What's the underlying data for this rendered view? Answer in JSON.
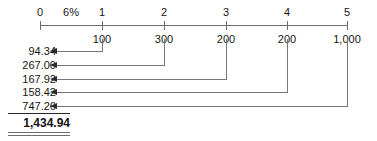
{
  "axis": {
    "rate_label": "6%",
    "rate_position_period": 0.5,
    "periods": [
      {
        "top_label": "0",
        "bottom_label": "",
        "x": 40
      },
      {
        "top_label": "1",
        "bottom_label": "100",
        "x": 102
      },
      {
        "top_label": "2",
        "bottom_label": "300",
        "x": 164
      },
      {
        "top_label": "3",
        "bottom_label": "200",
        "x": 226
      },
      {
        "top_label": "4",
        "bottom_label": "200",
        "x": 287
      },
      {
        "top_label": "5",
        "bottom_label": "1,000",
        "x": 347
      }
    ]
  },
  "present_values": [
    {
      "amount": "94.34",
      "period": 1,
      "y": 51
    },
    {
      "amount": "267.00",
      "period": 2,
      "y": 65
    },
    {
      "amount": "167.92",
      "period": 3,
      "y": 79
    },
    {
      "amount": "158.42",
      "period": 4,
      "y": 92
    },
    {
      "amount": "747.26",
      "period": 5,
      "y": 106
    }
  ],
  "total": {
    "label": "",
    "value": "1,434.94"
  },
  "colors": {
    "axis": "#6e6e6e",
    "connector": "#777777",
    "arrowhead": "#2a2a2a",
    "text": "#151515",
    "total_rule": "#2a2a2a",
    "background": "#ffffff"
  }
}
